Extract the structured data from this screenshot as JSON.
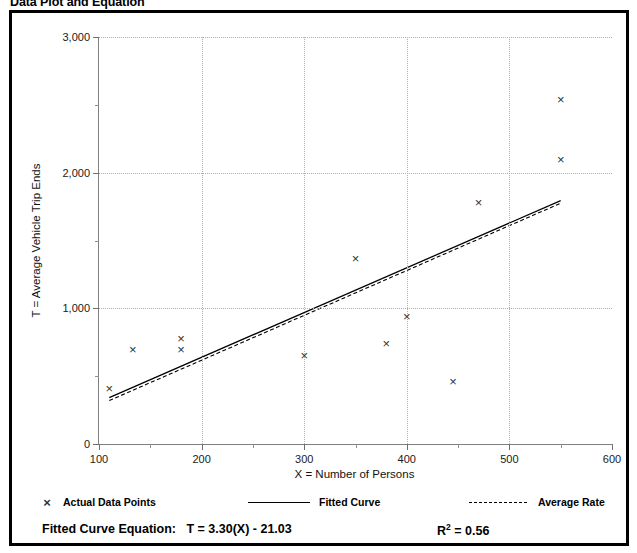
{
  "title": "Data Plot and Equation",
  "chart_data": {
    "type": "scatter",
    "title": "Data Plot and Equation",
    "xlabel": "X = Number of Persons",
    "ylabel": "T = Average Vehicle Trip Ends",
    "xlim": [
      100,
      600
    ],
    "ylim": [
      0,
      3000
    ],
    "xticks": [
      100,
      200,
      300,
      400,
      500,
      600
    ],
    "xtick_labels": [
      "100",
      "200",
      "300",
      "400",
      "500",
      "600"
    ],
    "xticks_minor": [
      150,
      250,
      350,
      450,
      550
    ],
    "yticks": [
      0,
      1000,
      2000,
      3000
    ],
    "ytick_labels": [
      "0",
      "1,000",
      "2,000",
      "3,000"
    ],
    "yticks_minor": [
      500,
      1500,
      2500
    ],
    "grid": "dotted gridlines at major x and y ticks",
    "legend_position": "below plot, horizontal",
    "series": [
      {
        "name": "Actual Data Points",
        "type": "scatter",
        "marker": "x",
        "points": [
          {
            "x": 110,
            "y": 410
          },
          {
            "x": 133,
            "y": 700
          },
          {
            "x": 180,
            "y": 780
          },
          {
            "x": 180,
            "y": 700
          },
          {
            "x": 300,
            "y": 650
          },
          {
            "x": 350,
            "y": 1370
          },
          {
            "x": 380,
            "y": 740
          },
          {
            "x": 400,
            "y": 940
          },
          {
            "x": 445,
            "y": 460
          },
          {
            "x": 470,
            "y": 1780
          },
          {
            "x": 550,
            "y": 2540
          },
          {
            "x": 550,
            "y": 2100
          }
        ]
      },
      {
        "name": "Fitted Curve",
        "type": "line",
        "style": "solid",
        "equation": "T = 3.30(X) - 21.03",
        "points": [
          {
            "x": 110,
            "y": 342
          },
          {
            "x": 550,
            "y": 1794
          }
        ]
      },
      {
        "name": "Average Rate",
        "type": "line",
        "style": "dashed",
        "points": [
          {
            "x": 110,
            "y": 320
          },
          {
            "x": 550,
            "y": 1775
          }
        ]
      }
    ]
  },
  "legend": {
    "items": [
      {
        "label": "Actual Data Points",
        "marker": "x-marker-icon"
      },
      {
        "label": "Fitted Curve",
        "marker": "solid-line-icon"
      },
      {
        "label": "Average Rate",
        "marker": "dashed-line-icon"
      }
    ]
  },
  "equation": {
    "label": "Fitted Curve Equation:",
    "value": "T = 3.30(X) - 21.03",
    "r_squared_symbol": "R",
    "r_squared_exponent": "2",
    "r_squared_value": "= 0.56"
  }
}
